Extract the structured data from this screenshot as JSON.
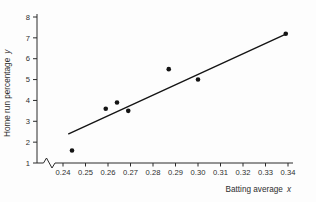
{
  "chart_data": {
    "type": "scatter",
    "title": "",
    "xlabel": "Batting average",
    "x_variable": "x",
    "ylabel": "Home run percentage",
    "y_variable": "y",
    "xlim": [
      0.24,
      0.34
    ],
    "ylim": [
      1,
      8
    ],
    "grid": false,
    "legend": false,
    "x_axis_break": true,
    "x_tick_labels": [
      "0.24",
      "0.25",
      "0.26",
      "0.27",
      "0.28",
      "0.29",
      "0.30",
      "0.31",
      "0.32",
      "0.33",
      "0.34"
    ],
    "y_tick_labels": [
      "1",
      "2",
      "3",
      "4",
      "5",
      "6",
      "7",
      "8"
    ],
    "points": [
      {
        "x": 0.244,
        "y": 1.6
      },
      {
        "x": 0.259,
        "y": 3.6
      },
      {
        "x": 0.264,
        "y": 3.9
      },
      {
        "x": 0.269,
        "y": 3.5
      },
      {
        "x": 0.287,
        "y": 5.5
      },
      {
        "x": 0.3,
        "y": 5.0
      },
      {
        "x": 0.339,
        "y": 7.2
      }
    ],
    "trend_line": {
      "x1": 0.2425,
      "y1": 2.4,
      "x2": 0.3395,
      "y2": 7.2
    },
    "marker_color": "#141414",
    "line_color": "#141414",
    "axis_color": "#2a2a2a"
  }
}
